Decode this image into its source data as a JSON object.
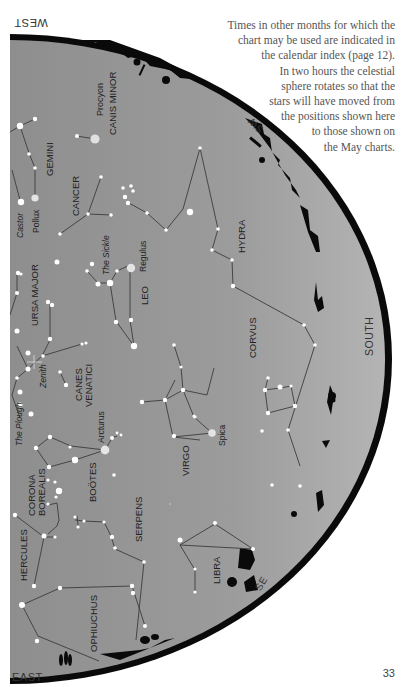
{
  "caption": {
    "lines": [
      "Times in other months for which the",
      "chart may be used are indicated in",
      "the calendar index (page 12).",
      "In two hours the celestial",
      "sphere rotates so that the",
      "stars will have moved from",
      "the positions shown here",
      "to those shown on",
      "the May charts."
    ]
  },
  "page_number": "33",
  "compass": {
    "west": "WEST",
    "east": "EAST",
    "south": "SOUTH",
    "southwest": "SW",
    "southeast": "SE"
  },
  "colors": {
    "sky": "#9a9a9a",
    "horizon": "#0a0a0a",
    "star": "#ffffff",
    "line": "#3a3a3a",
    "page": "#ffffff"
  },
  "labels": {
    "procyon": "Procyon",
    "canis_minor": "CANIS MINOR",
    "gemini": "GEMINI",
    "castor": "Castor",
    "pollux": "Pollux",
    "cancer": "CANCER",
    "the_sickle": "The Sickle",
    "regulus": "Regulus",
    "hydra": "HYDRA",
    "ursa_major": "URSA MAJOR",
    "leo": "LEO",
    "zenith": "Zenith",
    "canes_venatici_1": "CANES",
    "canes_venatici_2": "VENATICI",
    "corvus": "CORVUS",
    "the_plough": "The Plough",
    "arcturus": "Arcturus",
    "virgo": "VIRGO",
    "spica": "Spica",
    "corona_1": "CORONA",
    "corona_2": "BOREALIS",
    "bootes": "BOÖTES",
    "serpens": "SERPENS",
    "hercules": "HERCULES",
    "libra": "LIBRA",
    "ophiuchus": "OPHIUCHUS"
  }
}
